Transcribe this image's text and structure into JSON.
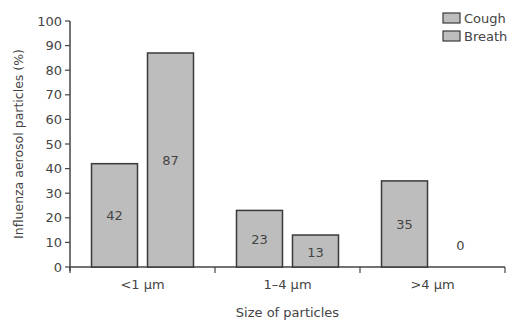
{
  "chart_data": {
    "type": "bar",
    "title": "",
    "xlabel": "Size of particles",
    "ylabel": "Influenza aerosol particles (%)",
    "ylim": [
      0,
      100
    ],
    "yticks": [
      0,
      10,
      20,
      30,
      40,
      50,
      60,
      70,
      80,
      90,
      100
    ],
    "grid": false,
    "legend_position": "top-right",
    "categories": [
      "<1 µm",
      "1–4 µm",
      ">4 µm"
    ],
    "series": [
      {
        "name": "Cough",
        "values": [
          42,
          23,
          35
        ],
        "color": "#bdbdbd"
      },
      {
        "name": "Breath",
        "values": [
          87,
          13,
          0
        ],
        "color": "#bdbdbd"
      }
    ],
    "bar_labels": [
      [
        "42",
        "23",
        "35"
      ],
      [
        "87",
        "13",
        "0"
      ]
    ]
  },
  "colors": {
    "bar_fill": "#bdbdbd",
    "bar_stroke": "#3a3a3a",
    "axis": "#444444",
    "text": "#444444"
  }
}
